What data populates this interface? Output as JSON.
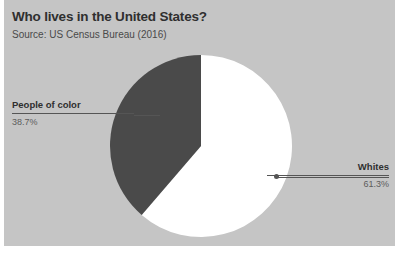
{
  "card": {
    "background_color": "#c5c5c5"
  },
  "header": {
    "title": "Who lives in the United States?",
    "subtitle": "Source: US Census Bureau (2016)"
  },
  "callouts": {
    "left": {
      "name": "People of color",
      "value": "38.7%"
    },
    "right": {
      "name": "Whites",
      "value": "61.3%"
    }
  },
  "chart_data": {
    "type": "pie",
    "title": "Who lives in the United States?",
    "subtitle": "Source: US Census Bureau (2016)",
    "xlabel": "",
    "ylabel": "",
    "legend_position": "callout-labels",
    "grid": false,
    "start_angle_deg": 0,
    "direction": "clockwise",
    "categories": [
      "Whites",
      "People of color"
    ],
    "values": [
      61.3,
      38.7
    ],
    "value_labels": [
      "61.3%",
      "38.7%"
    ],
    "colors": [
      "#ffffff",
      "#4a4a4a"
    ],
    "slices": [
      {
        "label": "Whites",
        "value": 61.3,
        "value_label": "61.3%",
        "color": "#ffffff",
        "start_angle_deg": 0,
        "end_angle_deg": 220.7
      },
      {
        "label": "People of color",
        "value": 38.7,
        "value_label": "38.7%",
        "color": "#4a4a4a",
        "start_angle_deg": 220.7,
        "end_angle_deg": 360
      }
    ],
    "total": 100
  }
}
